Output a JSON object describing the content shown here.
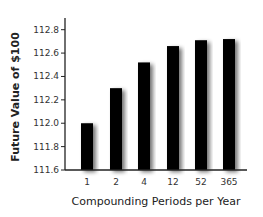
{
  "chart_data": {
    "type": "bar",
    "title": "",
    "xlabel": "Compounding Periods per Year",
    "ylabel": "Future Value of $100",
    "categories": [
      "1",
      "2",
      "4",
      "12",
      "52",
      "365"
    ],
    "values": [
      112.0,
      112.3,
      112.52,
      112.66,
      112.71,
      112.72
    ],
    "ylim": [
      111.6,
      112.8
    ],
    "yticks": [
      "111.6",
      "111.8",
      "112.0",
      "112.2",
      "112.4",
      "112.6",
      "112.8"
    ],
    "grid": false,
    "legend": null,
    "bar_color": "#000000"
  }
}
